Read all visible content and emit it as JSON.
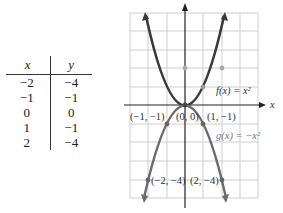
{
  "table": {
    "headers": [
      "x",
      "y"
    ],
    "rows": [
      [
        "−2",
        "−4"
      ],
      [
        "−1",
        "−1"
      ],
      [
        "0",
        "0"
      ],
      [
        "1",
        "−1"
      ],
      [
        "2",
        "−4"
      ]
    ]
  },
  "graph": {
    "x_axis_label": "x",
    "y_axis_label": "y",
    "f_label": "f(x) = x²",
    "g_label": "g(x) = −x²",
    "point_labels": {
      "neg1_neg1": "(−1, −1)",
      "origin": "(0, 0)",
      "pos1_neg1": "(1, −1)",
      "neg2_neg4": "(−2, −4)",
      "pos2_neg4": "(2, −4)"
    },
    "colors": {
      "f_curve": "#3a3a3a",
      "g_curve": "#6b6b6b",
      "grid": "#cfcfcf",
      "axis": "#222222"
    }
  }
}
